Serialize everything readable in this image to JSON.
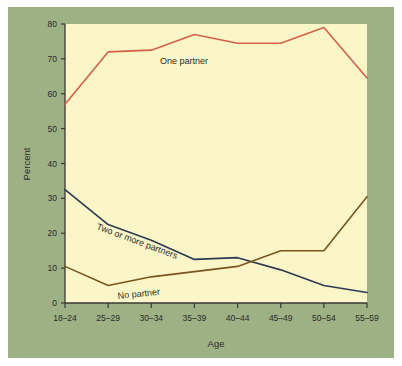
{
  "figure": {
    "background_color": "#9eb184",
    "plot_background_color": "#fbf6c8",
    "outer_background_color": "#ffffff",
    "axis_color": "#3a3a33"
  },
  "chart_data": {
    "type": "line",
    "title": "",
    "xlabel": "Age",
    "ylabel": "Percent",
    "categories": [
      "18–24",
      "25–29",
      "30–34",
      "35–39",
      "40–44",
      "45–49",
      "50–54",
      "55–59"
    ],
    "xtick_labels": [
      "18–24",
      "25–29",
      "30–34",
      "35–39",
      "40–44",
      "45–49",
      "50–54",
      "55–59"
    ],
    "ytick_labels": [
      "0",
      "10",
      "20",
      "30",
      "40",
      "50",
      "60",
      "70",
      "80"
    ],
    "yticks": [
      0,
      10,
      20,
      30,
      40,
      50,
      60,
      70,
      80
    ],
    "ylim": [
      0,
      80
    ],
    "grid": false,
    "legend": "inline-annotations",
    "series": [
      {
        "name": "One partner",
        "color": "#d4604a",
        "label_text": "One partner",
        "values": [
          57,
          72,
          72.5,
          77,
          74.5,
          74.5,
          79,
          64.5
        ]
      },
      {
        "name": "Two or more partners",
        "color": "#2b3a52",
        "label_text": "Two or more partners",
        "values": [
          32.5,
          22.5,
          18,
          12.5,
          13,
          9.5,
          5,
          3
        ]
      },
      {
        "name": "No partner",
        "color": "#7a5520",
        "label_text": "No partner",
        "values": [
          10.5,
          5,
          7.5,
          9,
          10.5,
          15,
          15,
          30.5
        ]
      }
    ],
    "annotations": [
      {
        "text": "One partner",
        "series": "One partner"
      },
      {
        "text": "Two or more partners",
        "series": "Two or more partners"
      },
      {
        "text": "No partner",
        "series": "No partner"
      }
    ]
  }
}
